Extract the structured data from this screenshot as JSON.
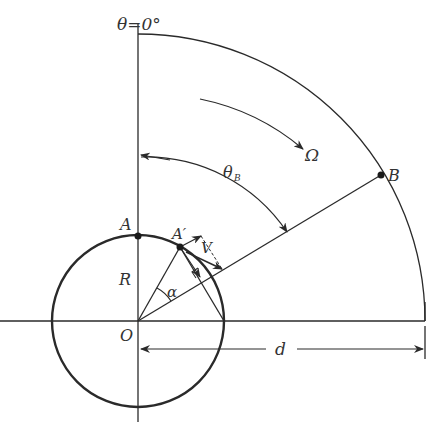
{
  "diagram": {
    "colors": {
      "stroke": "#2a2a2a",
      "text": "#333333",
      "background": "#ffffff"
    },
    "labels": {
      "theta_zero": "θ=0°",
      "omega": "Ω",
      "theta_b_main": "θ",
      "theta_b_sub": "B",
      "point_b": "B",
      "point_a": "A",
      "point_a_prime": "A′",
      "velocity": "V",
      "radius": "R",
      "alpha": "α",
      "origin": "O",
      "distance": "d"
    }
  }
}
